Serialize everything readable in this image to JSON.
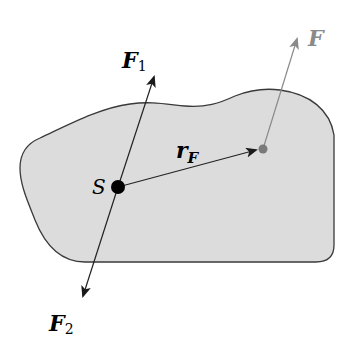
{
  "diagram": {
    "type": "rigid-body force diagram",
    "colors": {
      "background": "#ffffff",
      "body_fill": "#dcdcdc",
      "body_stroke": "#3a3a3a",
      "force_line": "#222222",
      "force_F": "#8a8a8a",
      "point_S": "#000000",
      "point_F": "#7a7a7a"
    },
    "labels": {
      "F1_main": "F",
      "F1_sub": "1",
      "F2_main": "F",
      "F2_sub": "2",
      "F": "F",
      "rF_main": "r",
      "rF_sub": "F",
      "S": "S"
    },
    "elements": [
      {
        "id": "body",
        "kind": "closed-region",
        "description": "irregular rigid body"
      },
      {
        "id": "S",
        "kind": "point",
        "description": "center of mass S"
      },
      {
        "id": "F1",
        "kind": "vector",
        "from": "S",
        "direction": "up-right"
      },
      {
        "id": "F2",
        "kind": "vector",
        "from": "S",
        "direction": "down-left"
      },
      {
        "id": "rF",
        "kind": "vector",
        "from": "S",
        "to": "point of application of F"
      },
      {
        "id": "F",
        "kind": "vector",
        "from": "point of application",
        "direction": "up-right"
      }
    ]
  }
}
